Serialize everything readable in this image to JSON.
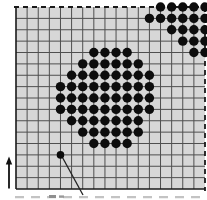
{
  "figure": {
    "canvas": {
      "width": 207,
      "height": 200,
      "background": "#ffffff"
    },
    "lattice": {
      "left": 16,
      "top": 7,
      "right": 205,
      "bottom": 189,
      "cols": 17,
      "rows": 16,
      "bg_color": "#d7d7d7",
      "inner_line_color": "#4f4f4f",
      "boundary_color": "#1a1a1a",
      "dashed_edges": [
        "top",
        "right"
      ],
      "solid_edges": [
        "left",
        "bottom"
      ],
      "dash_on": 5,
      "dash_off": 4
    },
    "dot": {
      "radius": 4.7,
      "color": "#0d0d0d"
    },
    "central_island_rows": [
      {
        "row": 4,
        "from": 7,
        "to": 10
      },
      {
        "row": 5,
        "from": 6,
        "to": 11
      },
      {
        "row": 6,
        "from": 5,
        "to": 12
      },
      {
        "row": 7,
        "from": 4,
        "to": 12
      },
      {
        "row": 8,
        "from": 4,
        "to": 12
      },
      {
        "row": 9,
        "from": 4,
        "to": 12
      },
      {
        "row": 10,
        "from": 5,
        "to": 11
      },
      {
        "row": 11,
        "from": 6,
        "to": 11
      },
      {
        "row": 12,
        "from": 7,
        "to": 10
      }
    ],
    "corner_island_rows": [
      {
        "row": 0,
        "from": 13,
        "to": 17
      },
      {
        "row": 1,
        "from": 12,
        "to": 17
      },
      {
        "row": 2,
        "from": 14,
        "to": 17
      },
      {
        "row": 3,
        "from": 15,
        "to": 17
      },
      {
        "row": 4,
        "from": 16,
        "to": 17
      }
    ],
    "monomer": {
      "col": 4,
      "row": 13
    },
    "monomer_pointer": {
      "x1": 62.5,
      "y1": 157.5,
      "x2": 83,
      "y2": 195,
      "color": "#222222",
      "width": 1.3
    },
    "axis_arrow": {
      "x": 9,
      "y_tail": 188.5,
      "y_head": 156.5,
      "color": "#111111",
      "width": 1.8
    },
    "caption_fragment": {
      "y": 197.2,
      "x1": 15,
      "x2": 205,
      "color": "#c3c3c3",
      "dash_on": 9,
      "dash_off": 7
    }
  }
}
